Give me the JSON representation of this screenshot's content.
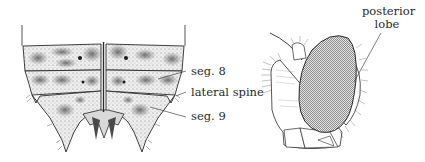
{
  "figure": {
    "left_panel": {
      "subject": "abdomen-dorsal-view",
      "labels": [
        {
          "id": "seg8",
          "text": "seg. 8"
        },
        {
          "id": "lateral_spine",
          "text": "lateral spine"
        },
        {
          "id": "seg9",
          "text": "seg. 9"
        }
      ]
    },
    "right_panel": {
      "subject": "head-lateral-view",
      "labels": [
        {
          "id": "posterior_lobe_line1",
          "text": "posterior"
        },
        {
          "id": "posterior_lobe_line2",
          "text": "lobe"
        }
      ]
    },
    "colors": {
      "ink": "#2a2a2a",
      "shade_dark": "#5a5a5a",
      "shade_light": "#bdbdbd",
      "paper": "#ffffff"
    }
  }
}
